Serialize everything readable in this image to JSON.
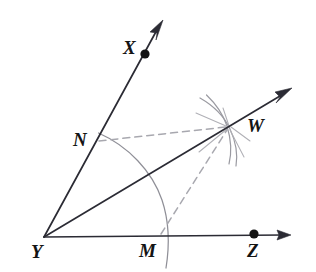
{
  "figure": {
    "background_color": "#ffffff",
    "ink_color": "#2b2b34",
    "construction_arc_color": "#8a8a92",
    "dashed_color": "#a6a6ad",
    "labels": {
      "vertex": "Y",
      "ray_upper_point": "X",
      "ray_lower_point": "Z",
      "arc_point_on_upper_ray": "N",
      "arc_point_on_lower_ray": "M",
      "bisector_point": "W"
    },
    "points": {
      "Y": {
        "x": 44,
        "y": 237
      },
      "X": {
        "x": 145,
        "y": 54
      },
      "Z": {
        "x": 254,
        "y": 235
      },
      "N": {
        "x": 96,
        "y": 142
      },
      "M": {
        "x": 160,
        "y": 236
      },
      "W": {
        "x": 228,
        "y": 127
      }
    },
    "label_positions": {
      "Y": {
        "x": 31,
        "y": 242
      },
      "X": {
        "x": 123,
        "y": 38
      },
      "Z": {
        "x": 247,
        "y": 241
      },
      "N": {
        "x": 73,
        "y": 130
      },
      "M": {
        "x": 139,
        "y": 241
      },
      "W": {
        "x": 247,
        "y": 116
      }
    },
    "rays": [
      {
        "name": "ray-YX",
        "from": "Y",
        "through": "X",
        "arrow_tip": {
          "x": 163,
          "y": 21
        }
      },
      {
        "name": "ray-YZ",
        "from": "Y",
        "through": "Z",
        "arrow_tip": {
          "x": 291,
          "y": 235
        }
      },
      {
        "name": "ray-YW",
        "from": "Y",
        "through": "W",
        "arrow_tip": {
          "x": 292,
          "y": 88
        }
      }
    ],
    "dashed_segments": [
      {
        "name": "segment-NW",
        "from": "N",
        "to": "W"
      },
      {
        "name": "segment-MW",
        "from": "M",
        "to": "W"
      }
    ],
    "compass_arcs": [
      {
        "name": "arc-centered-at-Y",
        "center": "Y",
        "radius": 120,
        "passes_through": [
          "N",
          "M"
        ]
      },
      {
        "name": "arc-centered-at-N",
        "center": "N",
        "radius": 134,
        "passes_through": [
          "W"
        ]
      },
      {
        "name": "arc-centered-at-M",
        "center": "M",
        "radius": 130,
        "passes_through": [
          "W"
        ]
      }
    ],
    "dots": [
      "X",
      "Z"
    ]
  }
}
